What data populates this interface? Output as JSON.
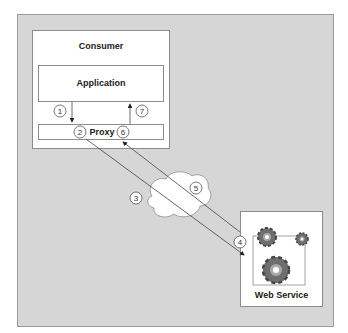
{
  "diagram": {
    "consumer": {
      "title": "Consumer"
    },
    "application": {
      "label": "Application"
    },
    "proxy": {
      "label": "Proxy"
    },
    "web_service": {
      "label": "Web Service"
    },
    "steps": [
      "1",
      "2",
      "3",
      "4",
      "5",
      "6",
      "7"
    ],
    "colors": {
      "frame_bg": "#d6d6d6",
      "box_bg": "#ffffff",
      "line": "#555555",
      "gear": "#6e6e6e"
    }
  }
}
